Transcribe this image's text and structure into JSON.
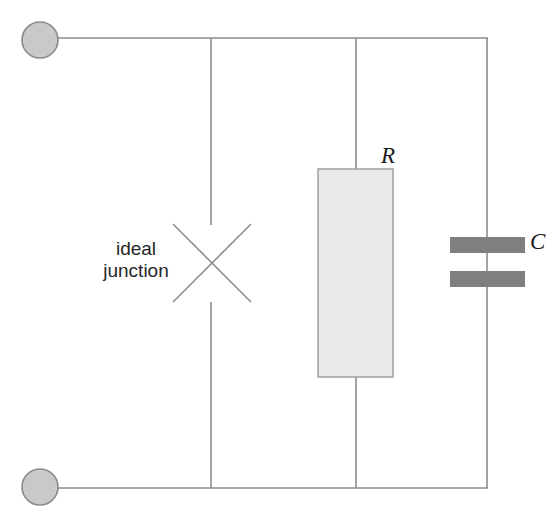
{
  "diagram": {
    "type": "circuit-schematic",
    "colors": {
      "wire": "#8d8d8d",
      "terminal_fill": "#c9c9c9",
      "terminal_stroke": "#8a8a8a",
      "resistor_fill": "#e9e9e9",
      "resistor_stroke": "#9a9a9a",
      "capacitor_plate": "#7f7f7f",
      "cross_stroke": "#8d8d8d",
      "text": "#1c1c1c",
      "background": "#ffffff"
    },
    "labels": {
      "ideal_line1": "ideal",
      "ideal_line2": "junction",
      "resistor": "R",
      "capacitor": "C"
    },
    "elements": {
      "terminal_top": {
        "name": "top terminal node",
        "cx": 40,
        "cy": 40,
        "r": 18
      },
      "terminal_bottom": {
        "name": "bottom terminal node",
        "cx": 40,
        "cy": 487,
        "r": 18
      },
      "rail_top_y": 38,
      "rail_bottom_y": 488,
      "rail_right_x": 487,
      "branch_junction_x": 211,
      "branch_resistor_x": 356,
      "branch_capacitor_x": 487,
      "cross": {
        "cx": 212,
        "cy": 263,
        "half": 39
      },
      "resistor_box": {
        "x": 318,
        "y": 169,
        "width": 75,
        "height": 208
      },
      "capacitor_plate_top": {
        "x": 450,
        "y": 237,
        "width": 75,
        "height": 16
      },
      "capacitor_plate_bottom": {
        "x": 450,
        "y": 271,
        "width": 75,
        "height": 16
      }
    }
  }
}
